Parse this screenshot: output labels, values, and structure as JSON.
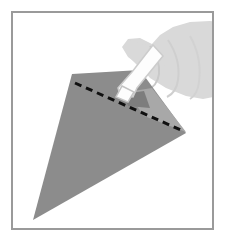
{
  "figure": {
    "title": "Applying glue along the folded edge of a cone-shaped paper piece",
    "caption": "",
    "step_number": "",
    "alt_text": "A hand holding a glue bottle squeezes glue along a dashed fold line across the top of a gray cone-shaped paper form",
    "frame": {
      "border_color": "#9a9a9a",
      "border_width_px": 2,
      "background_color": "#ffffff",
      "left_px": 11,
      "top_px": 11,
      "width_px": 203,
      "height_px": 219
    },
    "palette": {
      "paper_gray": "#8c8c8c",
      "paper_flap_gray": "#a8a8a8",
      "paper_shadow_gray": "#7d7d7d",
      "hand_gray": "#d9d9d9",
      "hand_outline_gray": "#c2c2c2",
      "bottle_white": "#fdfdfd",
      "bottle_outline_gray": "#c8c8c8",
      "dash_black": "#101010",
      "background_white": "#ffffff"
    },
    "shapes": [
      {
        "name": "paper-cone",
        "label": "Gray cone shaped paper form",
        "fill": "#8c8c8c",
        "points": "72,74 140,70 186,133 33,220"
      },
      {
        "name": "paper-flap",
        "label": "Lighter folded flap near glue tip",
        "fill": "#a8a8a8",
        "points": "127,92 152,88 186,132 144,116"
      },
      {
        "name": "glue-shadow",
        "label": "Shadow under the glue bottle tip",
        "fill": "#7d7d7d",
        "points": "124,94 144,91 150,108 128,106"
      },
      {
        "name": "hand",
        "label": "Hand gripping the glue bottle",
        "fill": "#d9d9d9",
        "points": "227,24 227,94 203,99 186,96 166,88 150,78 140,66 128,57 122,47 128,39 140,38 152,44 160,35 173,27 190,22 210,21"
      },
      {
        "name": "thumb",
        "label": "Thumb of the hand",
        "fill": "#d9d9d9",
        "points": "128,40 146,45 160,58 168,72 160,82 146,74 132,60 124,48"
      },
      {
        "name": "glue-bottle",
        "label": "White glue bottle",
        "fill": "#fdfdfd",
        "points": "153,45 163,56 137,88 133,97 120,95 118,88 132,72"
      },
      {
        "name": "bottle-tip",
        "label": "Nozzle tip of the glue bottle",
        "fill": "#fdfdfd",
        "points": "122,86 134,92 128,102 116,97"
      }
    ],
    "fold_line": {
      "name": "fold-dashed-line",
      "label": "Dashed fold / glue line",
      "style": "dashed",
      "color": "#101010",
      "stroke_width_px": 3,
      "dash_pattern": "7,5",
      "x1": 75,
      "y1": 83,
      "x2": 183,
      "y2": 131
    }
  }
}
